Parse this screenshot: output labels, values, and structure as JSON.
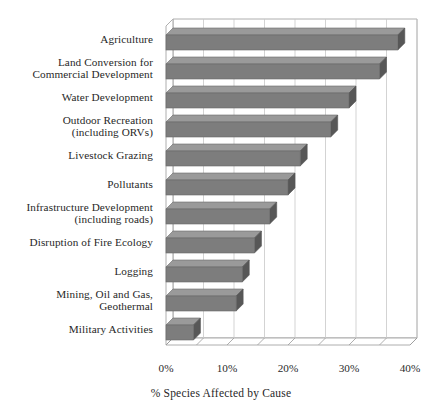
{
  "chart_data": {
    "type": "bar",
    "orientation": "horizontal",
    "title": "",
    "subtitle": "",
    "xlabel": "% Species Affected by Cause",
    "ylabel": "",
    "xlim": [
      0,
      40
    ],
    "xticks": [
      0,
      5,
      10,
      15,
      20,
      25,
      30,
      35,
      40
    ],
    "xtick_labels": [
      "0%",
      "",
      "10%",
      "",
      "20%",
      "",
      "30%",
      "",
      "40%"
    ],
    "major_xticks": [
      0,
      10,
      20,
      30,
      40
    ],
    "major_xtick_labels": [
      "0%",
      "10%",
      "20%",
      "30%",
      "40%"
    ],
    "grid": true,
    "grid_axis": "x",
    "legend": false,
    "legend_position": "none",
    "style": "3d-bar",
    "bar_color": "#7d7d7d",
    "bar_side_color": "#575757",
    "bar_top_color": "#9a9a9a",
    "axis_color": "#9a9a9a",
    "grid_color": "#c8c8c8",
    "categories": [
      "Agriculture",
      "Land Conversion for Commercial Development",
      "Water Development",
      "Outdoor Recreation (including ORVs)",
      "Livestock Grazing",
      "Pollutants",
      "Infrastructure Development (including roads)",
      "Disruption of Fire Ecology",
      "Logging",
      "Mining, Oil and Gas, Geothermal",
      "Military Activities"
    ],
    "category_lines": [
      [
        "Agriculture"
      ],
      [
        "Land Conversion for",
        "Commercial Development"
      ],
      [
        "Water Development"
      ],
      [
        "Outdoor Recreation",
        "(including ORVs)"
      ],
      [
        "Livestock Grazing"
      ],
      [
        "Pollutants"
      ],
      [
        "Infrastructure Development",
        "(including roads)"
      ],
      [
        "Disruption of Fire Ecology"
      ],
      [
        "Logging"
      ],
      [
        "Mining, Oil and Gas,",
        "Geothermal"
      ],
      [
        "Military Activities"
      ]
    ],
    "values": [
      38,
      35,
      30,
      27,
      22,
      20,
      17,
      14.5,
      12.5,
      11.5,
      4.5
    ]
  }
}
